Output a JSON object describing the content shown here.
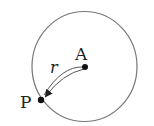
{
  "diagram": {
    "type": "geometry",
    "labels": {
      "center": "A",
      "point": "P",
      "radius": "r"
    },
    "colors": {
      "stroke": "#777777",
      "ink": "#222222"
    }
  }
}
